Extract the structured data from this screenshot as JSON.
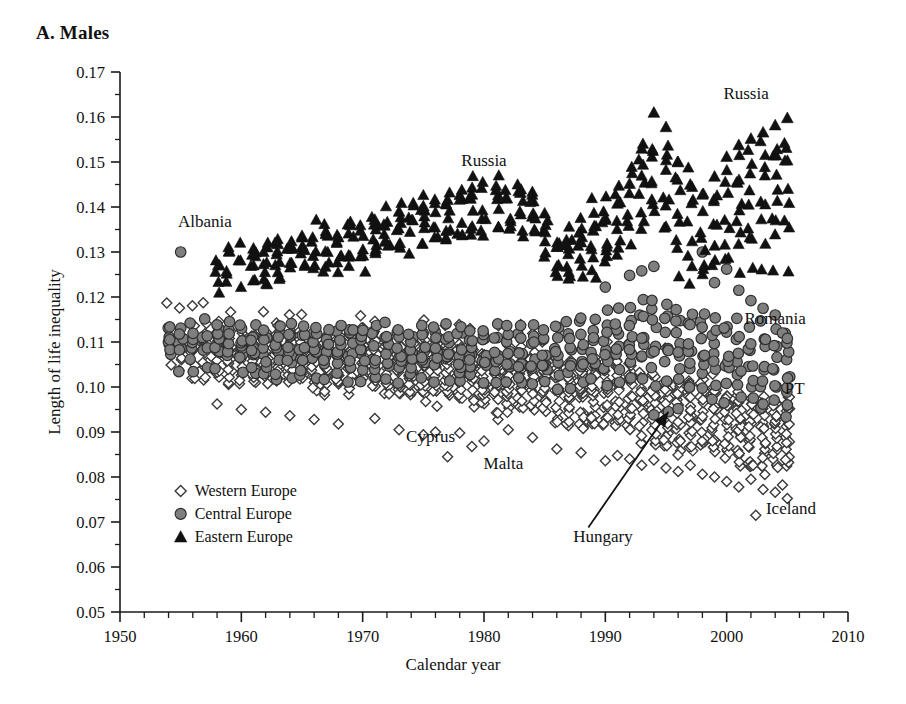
{
  "panel": {
    "title": "A. Males"
  },
  "chart_data": {
    "type": "scatter",
    "title": "A. Males",
    "xlabel": "Calendar year",
    "ylabel": "Length of life inequality",
    "xlim": [
      1950,
      2010
    ],
    "ylim": [
      0.05,
      0.17
    ],
    "x_major_ticks": [
      1950,
      1960,
      1970,
      1980,
      1990,
      2000,
      2010
    ],
    "x_tick_labels": [
      "1950",
      "1960",
      "1970",
      "1980",
      "1990",
      "2000",
      "2010"
    ],
    "x_minor_step": 2,
    "y_major_ticks": [
      0.05,
      0.06,
      0.07,
      0.08,
      0.09,
      0.1,
      0.11,
      0.12,
      0.13,
      0.14,
      0.15,
      0.16,
      0.17
    ],
    "y_tick_labels": [
      "0.05",
      "0.06",
      "0.07",
      "0.08",
      "0.09",
      "0.10",
      "0.11",
      "0.12",
      "0.13",
      "0.14",
      "0.15",
      "0.16",
      "0.17"
    ],
    "y_minor_step": 0.005,
    "grid": false,
    "legend_position": "bottom-left",
    "legend": [
      {
        "key": "western",
        "label": "Western Europe",
        "marker": "open-diamond",
        "color": "#ffffff",
        "edge": "#333333"
      },
      {
        "key": "central",
        "label": "Central Europe",
        "marker": "filled-circle",
        "color": "#808080",
        "edge": "#333333"
      },
      {
        "key": "eastern",
        "label": "Eastern Europe",
        "marker": "filled-triangle",
        "color": "#111111",
        "edge": "#111111"
      }
    ],
    "annotations": [
      {
        "text": "Albania",
        "x": 1957.0,
        "y": 0.1355,
        "anchor": "middle"
      },
      {
        "text": "Russia",
        "x": 1980.0,
        "y": 0.1492,
        "anchor": "middle"
      },
      {
        "text": "Russia",
        "x": 2001.6,
        "y": 0.164,
        "anchor": "middle"
      },
      {
        "text": "Romania",
        "x": 2004.0,
        "y": 0.114,
        "anchor": "middle"
      },
      {
        "text": "PT",
        "x": 2005.6,
        "y": 0.0985,
        "anchor": "middle"
      },
      {
        "text": "Iceland",
        "x": 2005.3,
        "y": 0.0718,
        "anchor": "middle"
      },
      {
        "text": "Cyprus",
        "x": 1975.6,
        "y": 0.0878,
        "anchor": "middle"
      },
      {
        "text": "Malta",
        "x": 1981.6,
        "y": 0.0818,
        "anchor": "middle"
      },
      {
        "text": "Hungary",
        "x": 1989.8,
        "y": 0.0655,
        "anchor": "middle"
      }
    ],
    "arrow": {
      "from_x": 1988.6,
      "from_y": 0.0688,
      "to_x": 1995.2,
      "to_y": 0.0945,
      "label": "Hungary"
    },
    "series": [
      {
        "name": "Western Europe",
        "marker": "open-diamond",
        "n_points": 1120,
        "band": {
          "note": "dense band of ~20 Western European countries, 1954-2005",
          "center_1955": 0.1075,
          "center_1970": 0.1055,
          "center_1985": 0.1005,
          "center_1995": 0.095,
          "center_2005": 0.0885,
          "spread_1955": 0.011,
          "spread_2005": 0.0135
        },
        "notable": [
          {
            "label": "Cyprus",
            "x": 1977.0,
            "y": 0.0845
          },
          {
            "label": "Malta",
            "x": 1979.2,
            "y": 0.0868
          },
          {
            "label": "Iceland",
            "x": 2002.4,
            "y": 0.0715
          },
          {
            "label": "PT",
            "x": 2005.0,
            "y": 0.0962
          }
        ]
      },
      {
        "name": "Central Europe",
        "marker": "filled-circle",
        "n_points": 430,
        "band": {
          "note": "8-10 central European countries; drift upward after 1990",
          "center_1955": 0.1095,
          "center_1970": 0.1075,
          "center_1985": 0.106,
          "center_1995": 0.1105,
          "center_2005": 0.1035,
          "spread_1955": 0.008,
          "spread_2005": 0.011
        },
        "notable": [
          {
            "label": "Albania",
            "x": 1955.0,
            "y": 0.13
          },
          {
            "label": "Romania",
            "x": 2004.6,
            "y": 0.112
          },
          {
            "label": "Hungary",
            "x": 1995.2,
            "y": 0.0945
          }
        ]
      },
      {
        "name": "Eastern Europe",
        "marker": "filled-triangle",
        "n_points": 330,
        "band": {
          "note": "rises 1960s-1980, dips ~1986 (anti-alcohol campaign), spikes 1994, falls then rises again to 2005",
          "center_1958": 0.125,
          "center_1970": 0.1315,
          "center_1980": 0.1395,
          "center_1986": 0.1275,
          "center_1994": 0.147,
          "center_1998": 0.1345,
          "center_2005": 0.1455,
          "spread_1958": 0.0065,
          "spread_1994": 0.0135,
          "spread_2005": 0.014
        },
        "notable": [
          {
            "label": "Russia",
            "x": 1994.2,
            "y": 0.161
          },
          {
            "label": "Russia",
            "x": 2005.0,
            "y": 0.1598
          }
        ]
      }
    ]
  }
}
